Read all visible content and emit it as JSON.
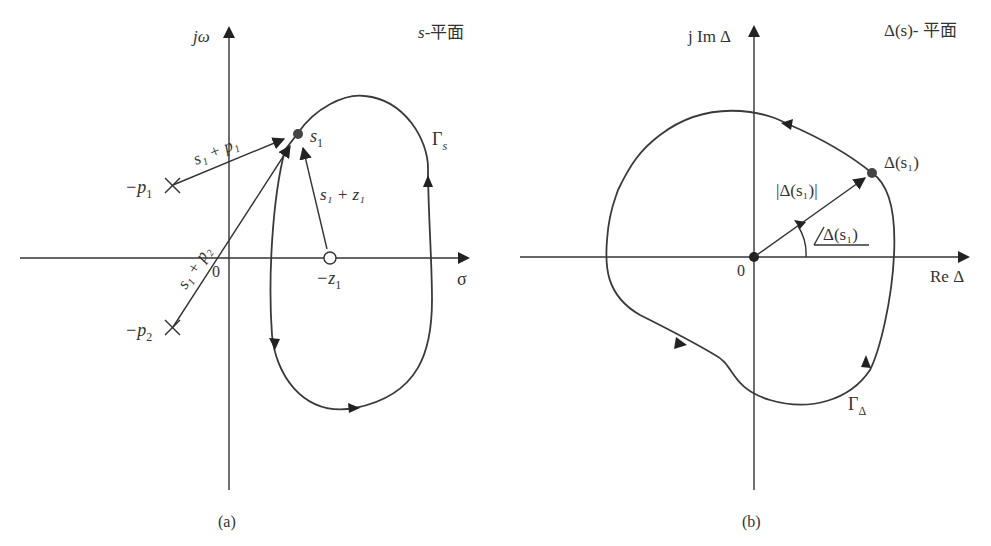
{
  "panel_a": {
    "plane_label": "s-平面",
    "plane_label_var": "s",
    "plane_label_suffix": "-平面",
    "y_axis_label": "jω",
    "x_axis_label": "σ",
    "origin_label": "0",
    "caption": "(a)",
    "contour_label": "Γ",
    "contour_sub": "s",
    "point_label": "s",
    "point_sub": "1",
    "pole1_label": "−p",
    "pole1_sub": "1",
    "pole2_label": "−p",
    "pole2_sub": "2",
    "zero_label": "−z",
    "zero_sub": "1",
    "vec_p1_label": "s₁ + p₁",
    "vec_p2_label": "s₁ + p₂",
    "vec_z1_label": "s₁ + z₁"
  },
  "panel_b": {
    "plane_label": "Δ(s)- 平面",
    "y_axis_label": "j Im Δ",
    "x_axis_label": "Re Δ",
    "origin_label": "0",
    "caption": "(b)",
    "contour_label": "Γ",
    "contour_sub": "Δ",
    "point_label": "Δ(s₁)",
    "magnitude_label": "|Δ(s₁)|",
    "angle_label": "Δ(s₁)"
  },
  "colors": {
    "ink": "#333333",
    "background": "#ffffff"
  }
}
